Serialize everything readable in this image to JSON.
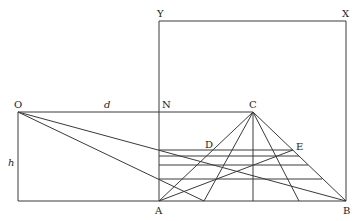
{
  "diagram": {
    "type": "geometric-construction",
    "colors": {
      "stroke": "#3a3a3a",
      "label": "#222222",
      "background": "#ffffff"
    },
    "points": {
      "Y": {
        "label": "Y",
        "x": 159,
        "y": 21
      },
      "X": {
        "label": "X",
        "x": 346,
        "y": 21
      },
      "O": {
        "label": "O",
        "x": 18,
        "y": 112
      },
      "N": {
        "label": "N",
        "x": 159,
        "y": 112
      },
      "C": {
        "label": "C",
        "x": 253,
        "y": 112
      },
      "D": {
        "label": "D",
        "x": 210,
        "y": 150
      },
      "E": {
        "label": "E",
        "x": 293,
        "y": 150
      },
      "A": {
        "label": "A",
        "x": 159,
        "y": 201
      },
      "B": {
        "label": "B",
        "x": 346,
        "y": 201
      }
    },
    "measure_labels": {
      "d": "d",
      "h": "h"
    },
    "labels": {
      "Y": "Y",
      "X": "X",
      "O": "O",
      "N": "N",
      "C": "C",
      "D": "D",
      "E": "E",
      "A": "A",
      "B": "B",
      "d": "d",
      "h": "h"
    }
  }
}
